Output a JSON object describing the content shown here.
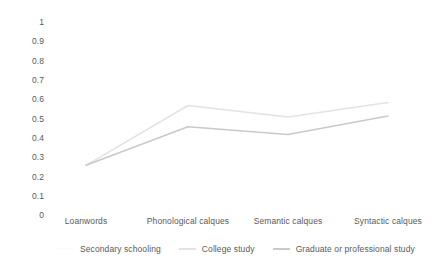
{
  "chart_data": {
    "type": "line",
    "title": "",
    "xlabel": "",
    "ylabel": "",
    "ylim": [
      0,
      1
    ],
    "grid": false,
    "legend_position": "bottom",
    "categories": [
      "Loanwords",
      "Phonological calques",
      "Semantic calques",
      "Syntactic calques"
    ],
    "ytick_labels": [
      "1",
      "0.9",
      "0.8",
      "0.7",
      "0.6",
      "0.5",
      "0.4",
      "0.3",
      "0.2",
      "0.1",
      "0"
    ],
    "ytick_values": [
      1,
      0.9,
      0.8,
      0.7,
      0.6,
      0.5,
      0.4,
      0.3,
      0.2,
      0.1,
      0
    ],
    "series": [
      {
        "name": "Secondary schooling",
        "color": "#fbfbfb",
        "values": [
          0.26,
          0.57,
          0.51,
          0.585
        ]
      },
      {
        "name": "College study",
        "color": "#e3e3e3",
        "values": [
          0.26,
          0.57,
          0.51,
          0.585
        ]
      },
      {
        "name": "Graduate or professional study",
        "color": "#c9c9c9",
        "values": [
          0.26,
          0.46,
          0.42,
          0.515
        ]
      }
    ]
  },
  "legend": {
    "items": [
      {
        "label": "Secondary schooling",
        "color": "#fbfbfb"
      },
      {
        "label": "College study",
        "color": "#e3e3e3"
      },
      {
        "label": "Graduate or professional study",
        "color": "#c9c9c9"
      }
    ]
  }
}
